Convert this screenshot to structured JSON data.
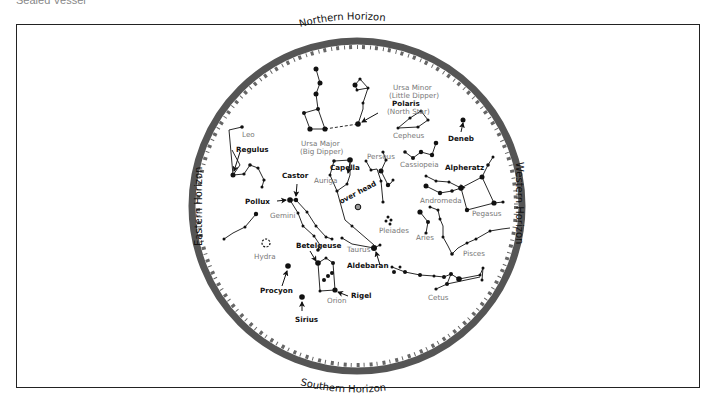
{
  "page": {
    "cut_title": "Sealed Vessel"
  },
  "chart": {
    "horizons": {
      "north": "Northern Horizon",
      "south": "Southern Horizon",
      "east": "Eastern Horizon",
      "west": "Western Horizon"
    },
    "overhead": "over head",
    "constellations": {
      "ursa_minor": "Ursa Minor",
      "ursa_minor_alt": "(Little Dipper)",
      "ursa_major": "Ursa Major",
      "ursa_major_alt": "(Big Dipper)",
      "cepheus": "Cepheus",
      "cassiopeia": "Cassiopeia",
      "leo": "Leo",
      "perseus": "Perseus",
      "auriga": "Auriga",
      "gemini": "Gemini",
      "andromeda": "Andromeda",
      "pegasus": "Pegasus",
      "pleiades": "Pleiades",
      "aries": "Aries",
      "pisces": "Pisces",
      "taurus": "Taurus",
      "hydra": "Hydra",
      "orion": "Orion",
      "cetus": "Cetus"
    },
    "stars": {
      "polaris": "Polaris",
      "polaris_alt": "(North Star)",
      "deneb": "Deneb",
      "regulus": "Regulus",
      "castor": "Castor",
      "capella": "Capella",
      "pollux": "Pollux",
      "alpheratz": "Alpheratz",
      "betelgeuse": "Betelgeuse",
      "aldebaran": "Aldebaran",
      "procyon": "Procyon",
      "rigel": "Rigel",
      "sirius": "Sirius"
    },
    "colors": {
      "horizon_ring": "#555555",
      "ink": "#111111",
      "label_gray": "#777777"
    }
  }
}
